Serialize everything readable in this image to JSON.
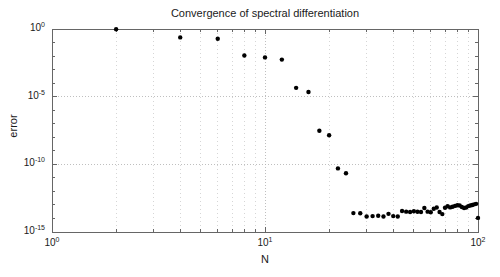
{
  "figure": {
    "background_color": "#ffffff",
    "axes_color": "#666666",
    "grid_color": "#b5b5b5",
    "marker_color": "#000000",
    "text_color": "#1a1a1a"
  },
  "axes_box": {
    "left": 52,
    "top": 29,
    "right": 478,
    "bottom": 232
  },
  "labels": {
    "title": "Convergence of spectral differentiation",
    "xlabel": "N",
    "ylabel": "error"
  },
  "ticks": {
    "x": [
      {
        "label_base": "10",
        "label_exp": "0",
        "value": 1
      },
      {
        "label_base": "10",
        "label_exp": "1",
        "value": 10
      },
      {
        "label_base": "10",
        "label_exp": "2",
        "value": 100
      }
    ],
    "y": [
      {
        "label_base": "10",
        "label_exp": "0",
        "value": 1
      },
      {
        "label_base": "10",
        "label_exp": "-5",
        "value": 1e-05
      },
      {
        "label_base": "10",
        "label_exp": "-10",
        "value": 1e-10
      },
      {
        "label_base": "10",
        "label_exp": "-15",
        "value": 1e-15
      }
    ]
  },
  "chart_data": {
    "type": "scatter",
    "title": "Convergence of spectral differentiation",
    "xlabel": "N",
    "ylabel": "error",
    "xscale": "log",
    "yscale": "log",
    "xlim": [
      1,
      100
    ],
    "ylim": [
      1e-15,
      1
    ],
    "grid": true,
    "legend": null,
    "marker": "filled-circle",
    "marker_color": "#000000",
    "marker_size_px": 4.4,
    "series": [
      {
        "name": "spectral differentiation error",
        "x": [
          2,
          4,
          6,
          8,
          10,
          12,
          14,
          16,
          18,
          20,
          22,
          24,
          26,
          28,
          30,
          32,
          34,
          36,
          38,
          40,
          42,
          44,
          46,
          48,
          50,
          52,
          54,
          56,
          58,
          60,
          62,
          64,
          66,
          68,
          70,
          72,
          74,
          76,
          78,
          80,
          82,
          84,
          86,
          88,
          90,
          92,
          94,
          96,
          98,
          100
        ],
        "y": [
          0.95,
          0.24,
          0.19,
          0.011,
          0.008,
          0.0055,
          4.5e-05,
          2.2e-05,
          3e-08,
          1.4e-08,
          5e-11,
          2.2e-11,
          2.5e-14,
          2.4e-14,
          1.4e-14,
          1.5e-14,
          1.6e-14,
          1.4e-14,
          2.2e-14,
          1.5e-14,
          1.4e-14,
          3.6e-14,
          3.2e-14,
          3e-14,
          3.4e-14,
          3.1e-14,
          3e-14,
          6e-14,
          3.2e-14,
          2.9e-14,
          5.2e-14,
          6.5e-14,
          3e-14,
          2.1e-14,
          6.2e-14,
          8e-14,
          6.6e-14,
          7.4e-14,
          8.5e-14,
          9.5e-14,
          9e-14,
          7e-14,
          6e-14,
          6.4e-14,
          8.2e-14,
          9e-14,
          1e-13,
          1.1e-13,
          1.2e-13,
          1.1e-14
        ]
      }
    ]
  }
}
